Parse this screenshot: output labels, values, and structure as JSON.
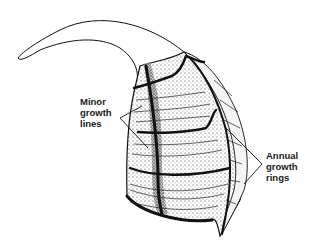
{
  "figure": {
    "labels": {
      "minor_growth_lines": "Minor\ngrowth\nlines",
      "annual_growth_rings": "Annual\ngrowth\nrings"
    },
    "colors": {
      "ink": "#111111",
      "stipple": "#444444",
      "background": "#ffffff"
    }
  }
}
